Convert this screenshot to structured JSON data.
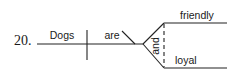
{
  "diagram": {
    "item_number": "20.",
    "subject": "Dogs",
    "verb": "are",
    "conjunction": "and",
    "complements": [
      "friendly",
      "loyal"
    ],
    "colors": {
      "ink": "#222222",
      "background": "#ffffff"
    }
  }
}
